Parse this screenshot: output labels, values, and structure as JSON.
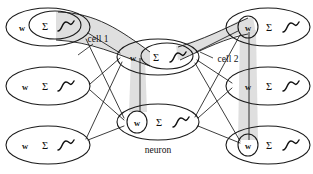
{
  "diagram": {
    "background_color": "#ffffff",
    "line_color": "#1a1a1a",
    "band_color": "#d9d9d9",
    "width": 313,
    "height": 174
  },
  "glyphs": {
    "weight": "w",
    "summation": "Σ",
    "activation": "sigmoid-curve"
  },
  "labels": {
    "cell1": "cell 1",
    "cell2": "cell 2",
    "neuron": "neuron"
  },
  "nodes": [
    {
      "id": "left-top",
      "label_w": "w",
      "label_sigma": "Σ",
      "activation": "sigmoid-curve",
      "cx": 48,
      "cy": 27,
      "rx": 42,
      "ry": 19,
      "inner": "ellipse-sigma",
      "inner_cx": 55,
      "inner_cy": 25,
      "inner_rx": 26,
      "inner_ry": 14,
      "w_x": 22,
      "sigma_x": 45,
      "curve_x": 64,
      "column": "input"
    },
    {
      "id": "left-middle",
      "label_w": "w",
      "label_sigma": "Σ",
      "activation": "sigmoid-curve",
      "cx": 48,
      "cy": 86,
      "rx": 42,
      "ry": 19,
      "inner": "none",
      "w_x": 25,
      "sigma_x": 45,
      "curve_x": 64,
      "column": "input"
    },
    {
      "id": "left-bottom",
      "label_w": "w",
      "label_sigma": "Σ",
      "activation": "sigmoid-curve",
      "cx": 48,
      "cy": 145,
      "rx": 42,
      "ry": 19,
      "inner": "none",
      "w_x": 25,
      "sigma_x": 45,
      "curve_x": 64,
      "column": "input"
    },
    {
      "id": "center-top",
      "label_w": "w",
      "label_sigma": "Σ",
      "activation": "sigmoid-curve",
      "cx": 158,
      "cy": 57,
      "rx": 41,
      "ry": 18,
      "inner": "ellipse-sigma",
      "inner_cx": 167,
      "inner_cy": 56,
      "inner_rx": 26,
      "inner_ry": 13,
      "w_x": 133,
      "sigma_x": 156,
      "curve_x": 176,
      "column": "hidden"
    },
    {
      "id": "center-bottom",
      "label_w": "w",
      "label_sigma": "Σ",
      "activation": "sigmoid-curve",
      "cx": 158,
      "cy": 122,
      "rx": 41,
      "ry": 18,
      "inner": "circle-w",
      "inner_cx": 137,
      "inner_cy": 122,
      "inner_rx": 10,
      "inner_ry": 11,
      "w_x": 137,
      "sigma_x": 159,
      "curve_x": 179,
      "column": "hidden"
    },
    {
      "id": "right-top",
      "label_w": "w",
      "label_sigma": "Σ",
      "activation": "sigmoid-curve",
      "cx": 268,
      "cy": 27,
      "rx": 42,
      "ry": 19,
      "inner": "circle-w",
      "inner_cx": 248,
      "inner_cy": 27,
      "inner_rx": 10,
      "inner_ry": 11,
      "w_x": 248,
      "sigma_x": 269,
      "curve_x": 289,
      "column": "output"
    },
    {
      "id": "right-middle",
      "label_w": "w",
      "label_sigma": "Σ",
      "activation": "sigmoid-curve",
      "cx": 268,
      "cy": 86,
      "rx": 42,
      "ry": 19,
      "inner": "none",
      "w_x": 248,
      "sigma_x": 269,
      "curve_x": 289,
      "column": "output"
    },
    {
      "id": "right-bottom",
      "label_w": "w",
      "label_sigma": "Σ",
      "activation": "sigmoid-curve",
      "cx": 268,
      "cy": 145,
      "rx": 42,
      "ry": 19,
      "inner": "circle-w",
      "inner_cx": 248,
      "inner_cy": 145,
      "inner_rx": 10,
      "inner_ry": 11,
      "w_x": 248,
      "sigma_x": 269,
      "curve_x": 289,
      "column": "output"
    }
  ],
  "edges": [
    {
      "from": "left-top",
      "to": "center-top"
    },
    {
      "from": "left-top",
      "to": "center-bottom"
    },
    {
      "from": "left-middle",
      "to": "center-top"
    },
    {
      "from": "left-middle",
      "to": "center-bottom"
    },
    {
      "from": "left-bottom",
      "to": "center-top"
    },
    {
      "from": "left-bottom",
      "to": "center-bottom"
    },
    {
      "from": "center-top",
      "to": "right-top"
    },
    {
      "from": "center-top",
      "to": "right-middle"
    },
    {
      "from": "center-top",
      "to": "right-bottom"
    },
    {
      "from": "center-bottom",
      "to": "right-top"
    },
    {
      "from": "center-bottom",
      "to": "right-middle"
    },
    {
      "from": "center-bottom",
      "to": "right-bottom"
    }
  ],
  "cells": [
    {
      "id": "cell-1",
      "label": "cell 1",
      "label_x": 98,
      "label_y": 39,
      "description": "band linking left-top activation to center-top activation and down to center-bottom weight"
    },
    {
      "id": "cell-2",
      "label": "cell 2",
      "label_x": 228,
      "label_y": 59,
      "description": "band linking center-top activation to right-top weight and down to right-bottom weight"
    }
  ]
}
